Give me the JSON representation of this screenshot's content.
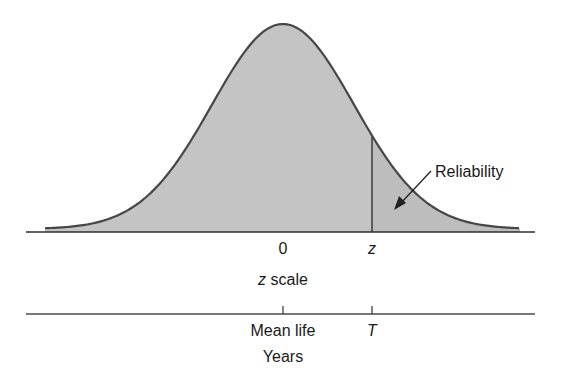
{
  "chart_data": {
    "type": "area",
    "title": "",
    "distribution": {
      "mean": 0,
      "std": 1
    },
    "x_range": [
      -3.5,
      3.5
    ],
    "cutoff_z": 1.25,
    "annotations": [
      {
        "text": "Reliability",
        "target": "shaded right tail area beyond z"
      }
    ],
    "axes": [
      {
        "name": "z scale",
        "ticks": [
          {
            "value": 0,
            "label": "0"
          },
          {
            "value": 1.25,
            "label": "z"
          }
        ]
      },
      {
        "name": "Years",
        "ticks": [
          {
            "value": 0,
            "label": "Mean life"
          },
          {
            "value": 1.25,
            "label": "T"
          }
        ]
      }
    ]
  },
  "labels": {
    "reliability": "Reliability",
    "z_tick_zero": "0",
    "z_tick_z": "z",
    "z_axis_italic": "z",
    "z_axis_rest": " scale",
    "years_tick_mean": "Mean life",
    "years_tick_T": "T",
    "years_axis": "Years"
  },
  "colors": {
    "fill": "#c4c4c4",
    "tail_fill": "#bdbdbd",
    "curve": "#474747",
    "axis": "#2e2e2e"
  }
}
